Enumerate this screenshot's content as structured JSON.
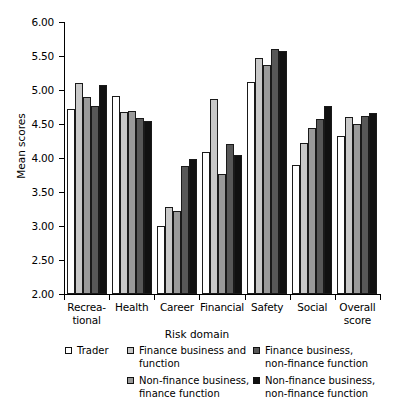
{
  "chart_data": {
    "type": "bar",
    "title": "",
    "xlabel": "Risk domain",
    "ylabel": "Mean scores",
    "ylim": [
      2.0,
      6.0
    ],
    "ytick_step": 0.5,
    "ytick_labels": [
      "6.00",
      "5.50",
      "5.00",
      "4.50",
      "4.00",
      "3.50",
      "3.00",
      "2.50",
      "2.00"
    ],
    "ytick_values": [
      6.0,
      5.5,
      5.0,
      4.5,
      4.0,
      3.5,
      3.0,
      2.5,
      2.0
    ],
    "grid": false,
    "legend_position": "bottom",
    "categories": [
      "Recrea-\ntional",
      "Health",
      "Career",
      "Financial",
      "Safety",
      "Social",
      "Overall\nscore"
    ],
    "series": [
      {
        "name": "Trader",
        "color": "#ffffff",
        "values": [
          4.72,
          4.91,
          3.0,
          4.09,
          5.12,
          3.9,
          4.33
        ]
      },
      {
        "name": "Finance business and function",
        "color": "#c8c8c8",
        "values": [
          5.11,
          4.68,
          3.28,
          4.87,
          5.47,
          4.22,
          4.6
        ]
      },
      {
        "name": "Finance business, non-finance function",
        "color": "#9a9a9a",
        "values": [
          4.89,
          4.69,
          3.22,
          3.76,
          5.37,
          4.44,
          4.5
        ]
      },
      {
        "name": "Non-finance business, finance function",
        "color": "#585858",
        "values": [
          4.76,
          4.59,
          3.88,
          4.2,
          5.6,
          4.58,
          4.62
        ]
      },
      {
        "name": "Non-finance business, non-finance function",
        "color": "#111111",
        "values": [
          5.08,
          4.54,
          3.98,
          4.04,
          5.58,
          4.77,
          4.66
        ]
      }
    ]
  },
  "legend": {
    "columns": [
      [
        {
          "label": "Trader",
          "color": "#ffffff"
        }
      ],
      [
        {
          "label": "Finance business and\nfunction",
          "color": "#c8c8c8"
        },
        {
          "label": "Non-finance business,\nfinance function",
          "color": "#9a9a9a"
        }
      ],
      [
        {
          "label": "Finance business,\nnon-finance function",
          "color": "#585858"
        },
        {
          "label": "Non-finance business,\nnon-finance function",
          "color": "#111111"
        }
      ]
    ]
  }
}
